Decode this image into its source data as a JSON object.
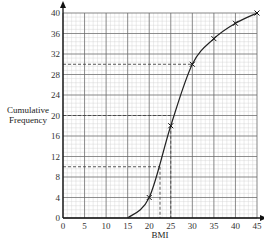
{
  "chart_data": {
    "type": "line",
    "title": "",
    "xlabel": "BMI",
    "ylabel": "Cumulative Frequency",
    "ylabel_lines": [
      "Cumulative",
      "Frequency"
    ],
    "xlim": [
      0,
      45
    ],
    "ylim": [
      0,
      40
    ],
    "x_ticks": [
      0,
      5,
      10,
      15,
      20,
      25,
      30,
      35,
      40,
      45
    ],
    "y_ticks": [
      0,
      4,
      8,
      12,
      16,
      20,
      24,
      28,
      32,
      36,
      40
    ],
    "grid": true,
    "series": [
      {
        "name": "cumulative frequency curve",
        "x": [
          15,
          20,
          25,
          30,
          35,
          40,
          45
        ],
        "y": [
          0,
          4,
          18,
          30,
          35,
          38,
          40
        ],
        "markers": [
          false,
          true,
          true,
          true,
          true,
          true,
          true
        ]
      }
    ],
    "annotations": [
      {
        "type": "dashed-horizontal",
        "y": 10,
        "x_to": 22.5
      },
      {
        "type": "dashed-vertical",
        "x": 22.5,
        "y_from": 10
      },
      {
        "type": "dashed-horizontal",
        "y": 20,
        "x_to": 25.3
      },
      {
        "type": "dashed-vertical",
        "x": 25,
        "y_from": 18
      },
      {
        "type": "dashed-horizontal",
        "y": 30,
        "x_to": 30
      }
    ]
  },
  "plot": {
    "x0_px": 63,
    "x1_px": 257,
    "y0_px": 218,
    "y1_px": 13
  }
}
